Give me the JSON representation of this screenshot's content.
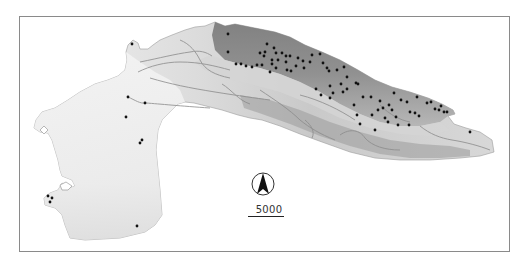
{
  "map": {
    "type": "grayscale elevation map with sample point locations",
    "background_color": "#ffffff",
    "frame_color": "#8a8a8a",
    "land_light_color": "#eaeaea",
    "land_dark_color": "#7a7a7a",
    "point_color": "#111111",
    "north_arrow": {
      "icon": "north-arrow-icon"
    },
    "scale_bar": {
      "label": "5000"
    },
    "points": [
      [
        132,
        44
      ],
      [
        128,
        97
      ],
      [
        145,
        103
      ],
      [
        126,
        117
      ],
      [
        142,
        140
      ],
      [
        140,
        143
      ],
      [
        48,
        196
      ],
      [
        52,
        198
      ],
      [
        50,
        202
      ],
      [
        137,
        226
      ],
      [
        228,
        34
      ],
      [
        228,
        52
      ],
      [
        236,
        64
      ],
      [
        241,
        64
      ],
      [
        246,
        66
      ],
      [
        252,
        67
      ],
      [
        257,
        65
      ],
      [
        262,
        65
      ],
      [
        267,
        44
      ],
      [
        274,
        48
      ],
      [
        276,
        53
      ],
      [
        282,
        53
      ],
      [
        286,
        56
      ],
      [
        290,
        56
      ],
      [
        298,
        58
      ],
      [
        303,
        61
      ],
      [
        264,
        56
      ],
      [
        265,
        52
      ],
      [
        260,
        53
      ],
      [
        272,
        60
      ],
      [
        278,
        60
      ],
      [
        286,
        62
      ],
      [
        287,
        70
      ],
      [
        291,
        71
      ],
      [
        270,
        72
      ],
      [
        272,
        64
      ],
      [
        276,
        68
      ],
      [
        296,
        66
      ],
      [
        304,
        68
      ],
      [
        310,
        62
      ],
      [
        312,
        55
      ],
      [
        320,
        54
      ],
      [
        323,
        63
      ],
      [
        327,
        68
      ],
      [
        329,
        71
      ],
      [
        337,
        70
      ],
      [
        344,
        67
      ],
      [
        347,
        77
      ],
      [
        341,
        84
      ],
      [
        330,
        86
      ],
      [
        347,
        89
      ],
      [
        356,
        83
      ],
      [
        358,
        84
      ],
      [
        333,
        93
      ],
      [
        343,
        92
      ],
      [
        316,
        89
      ],
      [
        321,
        95
      ],
      [
        330,
        98
      ],
      [
        354,
        105
      ],
      [
        363,
        97
      ],
      [
        371,
        97
      ],
      [
        378,
        110
      ],
      [
        380,
        101
      ],
      [
        389,
        105
      ],
      [
        394,
        93
      ],
      [
        401,
        100
      ],
      [
        407,
        102
      ],
      [
        410,
        112
      ],
      [
        417,
        97
      ],
      [
        427,
        103
      ],
      [
        431,
        102
      ],
      [
        435,
        109
      ],
      [
        439,
        110
      ],
      [
        441,
        106
      ],
      [
        444,
        112
      ],
      [
        447,
        112
      ],
      [
        375,
        130
      ],
      [
        396,
        117
      ],
      [
        383,
        108
      ],
      [
        385,
        118
      ],
      [
        388,
        122
      ],
      [
        357,
        115
      ],
      [
        372,
        115
      ],
      [
        392,
        110
      ],
      [
        415,
        113
      ],
      [
        419,
        116
      ],
      [
        409,
        125
      ],
      [
        470,
        132
      ],
      [
        360,
        124
      ],
      [
        398,
        125
      ]
    ]
  }
}
